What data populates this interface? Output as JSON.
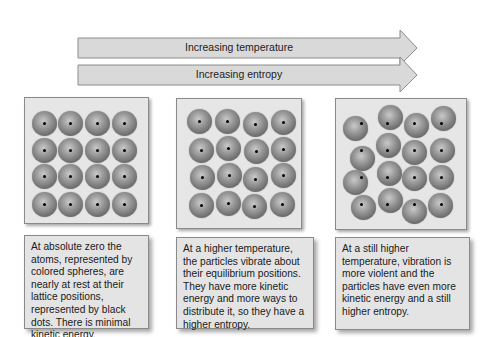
{
  "arrows": [
    {
      "label": "Increasing temperature"
    },
    {
      "label": "Increasing entropy"
    }
  ],
  "panels": [
    {
      "name": "absolute-zero",
      "spheres": [
        [
          44,
          123
        ],
        [
          70,
          123
        ],
        [
          97,
          123
        ],
        [
          124,
          123
        ],
        [
          44,
          150
        ],
        [
          70,
          150
        ],
        [
          97,
          150
        ],
        [
          124,
          150
        ],
        [
          44,
          176
        ],
        [
          70,
          176
        ],
        [
          97,
          176
        ],
        [
          124,
          176
        ],
        [
          44,
          204
        ],
        [
          70,
          204
        ],
        [
          97,
          204
        ],
        [
          124,
          204
        ]
      ],
      "caption": "At absolute zero the atoms, represented by colored spheres, are nearly at rest at their lattice positions, represented by black dots. There is minimal kinetic energy."
    },
    {
      "name": "higher-temperature",
      "spheres": [
        [
          199,
          121
        ],
        [
          227,
          121
        ],
        [
          255,
          124
        ],
        [
          283,
          122
        ],
        [
          201,
          150
        ],
        [
          228,
          148
        ],
        [
          256,
          151
        ],
        [
          283,
          149
        ],
        [
          202,
          177
        ],
        [
          229,
          175
        ],
        [
          255,
          179
        ],
        [
          283,
          175
        ],
        [
          201,
          205
        ],
        [
          228,
          203
        ],
        [
          254,
          206
        ],
        [
          282,
          204
        ]
      ],
      "caption": "At a higher temperature, the particles vibrate about their equilibrium positions. They have more kinetic energy and more ways to distribute it, so they have a higher entropy."
    },
    {
      "name": "still-higher-temperature",
      "spheres": [
        [
          355,
          128
        ],
        [
          390,
          117
        ],
        [
          416,
          125
        ],
        [
          443,
          118
        ],
        [
          388,
          145
        ],
        [
          414,
          152
        ],
        [
          442,
          150
        ],
        [
          362,
          158
        ],
        [
          355,
          182
        ],
        [
          389,
          173
        ],
        [
          414,
          178
        ],
        [
          441,
          177
        ],
        [
          363,
          207
        ],
        [
          390,
          200
        ],
        [
          414,
          211
        ],
        [
          440,
          205
        ]
      ],
      "dots": [
        [
          361,
          123
        ],
        [
          387,
          123
        ],
        [
          414,
          123
        ],
        [
          441,
          123
        ],
        [
          387,
          150
        ],
        [
          414,
          150
        ],
        [
          441,
          150
        ],
        [
          361,
          150
        ],
        [
          361,
          177
        ],
        [
          387,
          177
        ],
        [
          414,
          177
        ],
        [
          441,
          177
        ],
        [
          361,
          204
        ],
        [
          387,
          204
        ],
        [
          414,
          204
        ],
        [
          441,
          204
        ]
      ],
      "caption": "At a still higher temperature, vibration is more violent and the particles have even more kinetic energy and a still higher entropy."
    }
  ],
  "colors": {
    "arrow_fill": "#d9d9d9",
    "arrow_stroke": "#8c8c8c",
    "panel_bg": "#e6e6e6",
    "sphere": "#7a7a7a",
    "dot": "#000000"
  }
}
